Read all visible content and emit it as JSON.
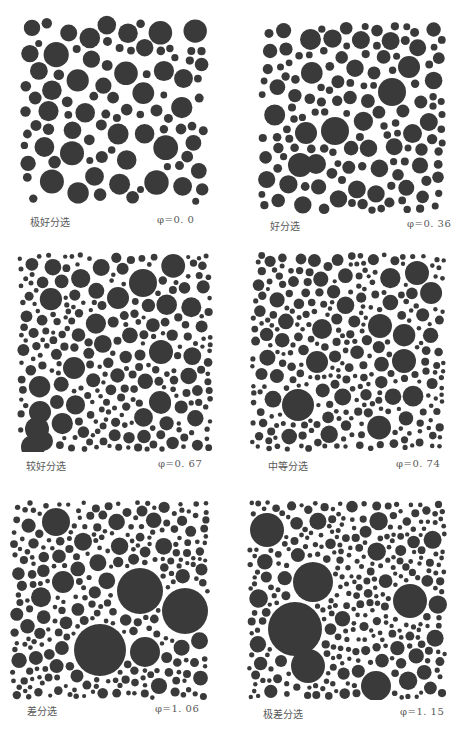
{
  "figure": {
    "panels": [
      {
        "id": "p1",
        "label": "极好分选",
        "phi": "φ=0. 0",
        "box": {
          "x": 20,
          "y": 15,
          "w": 190,
          "h": 190
        },
        "label_pos": {
          "x": 30,
          "y": 222
        },
        "phi_pos": {
          "x": 157,
          "y": 222
        },
        "seed": 11,
        "radii": [
          [
            11,
            0.55
          ],
          [
            9,
            0.3
          ],
          [
            6,
            0.1
          ],
          [
            4,
            0.05
          ]
        ],
        "count": 95,
        "fixed": []
      },
      {
        "id": "p2",
        "label": "好分选",
        "phi": "φ=0. 36",
        "box": {
          "x": 258,
          "y": 22,
          "w": 188,
          "h": 192
        },
        "label_pos": {
          "x": 270,
          "y": 226
        },
        "phi_pos": {
          "x": 407,
          "y": 226
        },
        "seed": 23,
        "radii": [
          [
            10,
            0.35
          ],
          [
            8,
            0.3
          ],
          [
            6,
            0.2
          ],
          [
            4,
            0.15
          ]
        ],
        "count": 230,
        "fixed": [
          [
            335,
            131,
            14
          ],
          [
            306,
            133,
            11
          ],
          [
            300,
            165,
            12
          ],
          [
            316,
            164,
            10
          ],
          [
            392,
            92,
            14
          ],
          [
            409,
            67,
            11
          ]
        ]
      },
      {
        "id": "p3",
        "label": "较好分选",
        "phi": "φ=0. 67",
        "box": {
          "x": 17,
          "y": 252,
          "w": 196,
          "h": 200
        },
        "label_pos": {
          "x": 26,
          "y": 466
        },
        "phi_pos": {
          "x": 158,
          "y": 466
        },
        "seed": 37,
        "radii": [
          [
            11,
            0.2
          ],
          [
            8,
            0.25
          ],
          [
            6,
            0.25
          ],
          [
            4,
            0.2
          ],
          [
            2.5,
            0.1
          ]
        ],
        "count": 330,
        "fixed": [
          [
            143,
            283,
            14
          ],
          [
            118,
            298,
            11
          ],
          [
            161,
            352,
            12
          ],
          [
            160,
            402,
            11
          ],
          [
            40,
            412,
            11
          ],
          [
            161,
            404,
            10
          ],
          [
            37,
            429,
            12
          ],
          [
            74,
            368,
            11
          ],
          [
            43,
            441,
            10
          ],
          [
            33,
            447,
            12
          ]
        ]
      },
      {
        "id": "p4",
        "label": "中等分选",
        "phi": "φ=0. 74",
        "box": {
          "x": 250,
          "y": 252,
          "w": 196,
          "h": 200
        },
        "label_pos": {
          "x": 268,
          "y": 466
        },
        "phi_pos": {
          "x": 396,
          "y": 466
        },
        "seed": 53,
        "radii": [
          [
            11,
            0.2
          ],
          [
            8,
            0.25
          ],
          [
            6,
            0.2
          ],
          [
            4,
            0.2
          ],
          [
            2.5,
            0.15
          ]
        ],
        "count": 360,
        "fixed": [
          [
            298,
            405,
            16
          ],
          [
            417,
            273,
            12
          ],
          [
            380,
            326,
            12
          ],
          [
            404,
            361,
            12
          ],
          [
            317,
            362,
            11
          ],
          [
            322,
            329,
            10
          ]
        ]
      },
      {
        "id": "p5",
        "label": "差分选",
        "phi": "φ=1. 06",
        "box": {
          "x": 10,
          "y": 500,
          "w": 200,
          "h": 200
        },
        "label_pos": {
          "x": 27,
          "y": 711
        },
        "phi_pos": {
          "x": 155,
          "y": 711
        },
        "seed": 71,
        "radii": [
          [
            10,
            0.2
          ],
          [
            8,
            0.25
          ],
          [
            6,
            0.2
          ],
          [
            4,
            0.2
          ],
          [
            2.5,
            0.15
          ]
        ],
        "count": 330,
        "fixed": [
          [
            100,
            650,
            26
          ],
          [
            140,
            591,
            23
          ],
          [
            185,
            611,
            23
          ],
          [
            56,
            522,
            14
          ],
          [
            145,
            652,
            15
          ],
          [
            63,
            582,
            11
          ]
        ]
      },
      {
        "id": "p6",
        "label": "极差分选",
        "phi": "φ=1. 15",
        "box": {
          "x": 247,
          "y": 500,
          "w": 200,
          "h": 200
        },
        "label_pos": {
          "x": 263,
          "y": 714
        },
        "phi_pos": {
          "x": 400,
          "y": 714
        },
        "seed": 97,
        "radii": [
          [
            10,
            0.15
          ],
          [
            8,
            0.2
          ],
          [
            6,
            0.25
          ],
          [
            4,
            0.2
          ],
          [
            2.5,
            0.2
          ]
        ],
        "count": 360,
        "fixed": [
          [
            267,
            530,
            17
          ],
          [
            295,
            629,
            27
          ],
          [
            313,
            582,
            20
          ],
          [
            410,
            601,
            17
          ],
          [
            308,
            666,
            17
          ],
          [
            376,
            686,
            15
          ]
        ]
      }
    ],
    "circle_color": "#3a3a3a",
    "caption_color": "#5a5a5a"
  }
}
